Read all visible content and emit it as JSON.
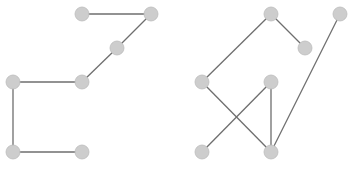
{
  "diagram": {
    "type": "graph",
    "colors": {
      "node_fill": "#cdcdcd",
      "node_stroke": "#bdbdbd",
      "edge": "#6e6e6e",
      "background": "#ffffff"
    },
    "node_radius": 7,
    "graphs": [
      {
        "name": "left-graph",
        "nodes": [
          {
            "id": "A",
            "x": 82,
            "y": 14
          },
          {
            "id": "B",
            "x": 151,
            "y": 14
          },
          {
            "id": "C",
            "x": 117,
            "y": 48
          },
          {
            "id": "D",
            "x": 82,
            "y": 82
          },
          {
            "id": "E",
            "x": 13,
            "y": 82
          },
          {
            "id": "F",
            "x": 13,
            "y": 152
          },
          {
            "id": "G",
            "x": 82,
            "y": 152
          }
        ],
        "edges": [
          [
            "A",
            "B"
          ],
          [
            "B",
            "C"
          ],
          [
            "C",
            "D"
          ],
          [
            "D",
            "E"
          ],
          [
            "E",
            "F"
          ],
          [
            "F",
            "G"
          ]
        ]
      },
      {
        "name": "right-graph",
        "nodes": [
          {
            "id": "H",
            "x": 271,
            "y": 14
          },
          {
            "id": "I",
            "x": 340,
            "y": 14
          },
          {
            "id": "J",
            "x": 305,
            "y": 48
          },
          {
            "id": "K",
            "x": 202,
            "y": 82
          },
          {
            "id": "L",
            "x": 271,
            "y": 82
          },
          {
            "id": "M",
            "x": 202,
            "y": 152
          },
          {
            "id": "N",
            "x": 271,
            "y": 152
          }
        ],
        "edges": [
          [
            "H",
            "K"
          ],
          [
            "H",
            "J"
          ],
          [
            "K",
            "N"
          ],
          [
            "L",
            "M"
          ],
          [
            "L",
            "N"
          ],
          [
            "I",
            "N"
          ]
        ]
      }
    ]
  }
}
